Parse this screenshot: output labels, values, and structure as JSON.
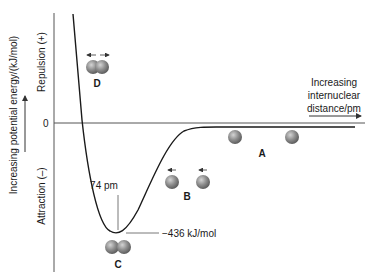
{
  "diagram": {
    "y_axis": {
      "label": "Increasing potential energy/(kJ/mol)",
      "upper_region": "Repulsion (+)",
      "lower_region": "Attraction (–)",
      "zero_label": "0"
    },
    "x_axis": {
      "label_line1": "Increasing",
      "label_line2": "internuclear",
      "label_line3": "distance/pm"
    },
    "annotations": {
      "bond_length": "74 pm",
      "bond_energy": "−436 kJ/mol"
    },
    "states": [
      {
        "id": "A",
        "label": "A",
        "description": "separated atoms, no interaction"
      },
      {
        "id": "B",
        "label": "B",
        "description": "atoms approaching, attraction"
      },
      {
        "id": "C",
        "label": "C",
        "description": "bonded molecule at minimum energy"
      },
      {
        "id": "D",
        "label": "D",
        "description": "atoms too close, repulsion"
      }
    ],
    "colors": {
      "curve": "#1a1a1a",
      "axis": "#555555",
      "atom_fill": "#8a8a8a",
      "atom_highlight": "#c8c8c8"
    }
  }
}
